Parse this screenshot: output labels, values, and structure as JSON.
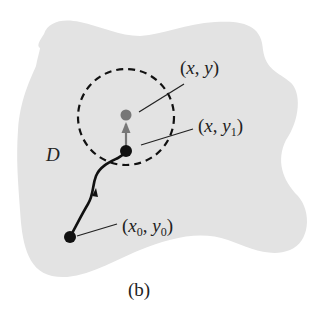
{
  "figure": {
    "caption": "(b)",
    "region_label": "D",
    "colors": {
      "region_fill": "#e3e3e3",
      "path": "#111111",
      "point_start": "#111111",
      "point_intermediate": "#111111",
      "point_target": "#777777",
      "arrow": "#777777",
      "circle": "#111111"
    },
    "points": [
      {
        "id": "start",
        "label_main": "x",
        "label_sub": "0",
        "label_main2": "y",
        "label_sub2": "0",
        "text": "(x0, y0)"
      },
      {
        "id": "intermediate",
        "text": "(x, y1)",
        "label_main": "x",
        "label_main2": "y",
        "label_sub2": "1"
      },
      {
        "id": "target",
        "text": "(x, y)",
        "label_main": "x",
        "label_main2": "y"
      }
    ],
    "labels": {
      "target": {
        "open": "(",
        "x": "x",
        "comma": ", ",
        "y": "y",
        "close": ")"
      },
      "intermediate": {
        "open": "(",
        "x": "x",
        "comma": ", ",
        "y": "y",
        "sub": "1",
        "close": ")"
      },
      "start": {
        "open": "(",
        "x": "x",
        "xsub": "0",
        "comma": ", ",
        "y": "y",
        "ysub": "0",
        "close": ")"
      }
    }
  }
}
